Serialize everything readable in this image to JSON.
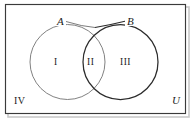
{
  "figure": {
    "type": "venn-diagram",
    "width": 194,
    "height": 121
  },
  "colors": {
    "background": "#ffffff",
    "frame_stroke": "#3a3a3a",
    "circle_a_stroke": "#7a7a7a",
    "circle_b_stroke": "#2b2b2b",
    "text": "#1b1b1b",
    "shadow": "#c9c9c9"
  },
  "sets": {
    "a": {
      "label": "A",
      "leader": true
    },
    "b": {
      "label": "B",
      "leader": true
    }
  },
  "regions": [
    {
      "id": "region-1",
      "label": "I",
      "meaning": "A only"
    },
    {
      "id": "region-2",
      "label": "II",
      "meaning": "A and B"
    },
    {
      "id": "region-3",
      "label": "III",
      "meaning": "B only"
    },
    {
      "id": "region-4",
      "label": "IV",
      "meaning": "outside A and B"
    }
  ],
  "universe": {
    "label": "U"
  },
  "geometry": {
    "frame": {
      "x": 5,
      "y": 4,
      "width": 181,
      "height": 110
    },
    "circle_a": {
      "cx": 67.5,
      "cy": 62,
      "r": 37.5
    },
    "circle_b": {
      "cx": 120.5,
      "cy": 62,
      "r": 37.5
    },
    "leader_a": {
      "x1": 66,
      "y1": 21,
      "x2": 96,
      "y2": 27
    },
    "leader_b": {
      "x1": 94,
      "y1": 27,
      "x2": 126,
      "y2": 21
    }
  }
}
